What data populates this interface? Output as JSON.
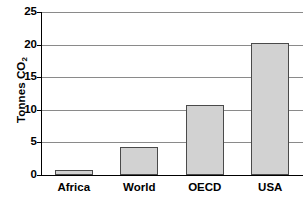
{
  "chart_data": {
    "type": "bar",
    "title": "",
    "subtitle": "",
    "xlabel": "",
    "ylabel": "Tonnes CO2",
    "ylabel_parts": {
      "text": "Tonnes CO",
      "subscript": "2"
    },
    "categories": [
      "Africa",
      "World",
      "OECD",
      "USA"
    ],
    "values": [
      0.8,
      4.3,
      10.8,
      20.2
    ],
    "ylim": [
      0,
      25
    ],
    "yticks": [
      0,
      5,
      10,
      15,
      20,
      25
    ],
    "ytick_labels": [
      "0",
      "5",
      "10",
      "15",
      "20",
      "25"
    ],
    "grid": "horizontal",
    "legend": "none",
    "bar_fill_color": "#d2d2d2",
    "bar_border_color": "#4a4a4a",
    "gridline_color": "#8a8a8a",
    "axis_color": "#000000",
    "background_color": "#ffffff"
  }
}
